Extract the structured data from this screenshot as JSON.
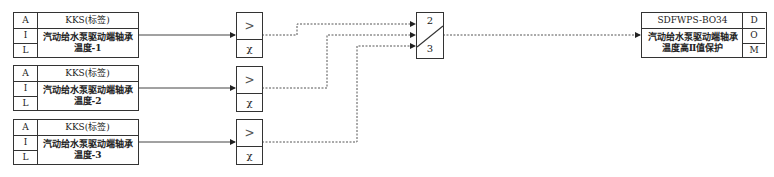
{
  "inputs": [
    {
      "rows": [
        "A",
        "I",
        "L"
      ],
      "tag": "KKS(标签)",
      "desc_line1": "汽动给水泵驱动端轴承",
      "desc_line2": "温度-1"
    },
    {
      "rows": [
        "A",
        "I",
        "L"
      ],
      "tag": "KKS(标签)",
      "desc_line1": "汽动给水泵驱动端轴承",
      "desc_line2": "温度-2"
    },
    {
      "rows": [
        "A",
        "I",
        "L"
      ],
      "tag": "KKS(标签)",
      "desc_line1": "汽动给水泵驱动端轴承",
      "desc_line2": "温度-3"
    }
  ],
  "comparators": [
    {
      "op": ">",
      "quality": "χ"
    },
    {
      "op": ">",
      "quality": "χ"
    },
    {
      "op": ">",
      "quality": "χ"
    }
  ],
  "voter": {
    "top": "2",
    "bottom": "3"
  },
  "output": {
    "tag": "SDFWPS-BO34",
    "desc_line1": "汽动给水泵驱动端轴承",
    "desc_line2": "温度高Ⅱ值保护",
    "rows": [
      "D",
      "O",
      "M"
    ]
  },
  "colors": {
    "line": "#333333",
    "background": "#ffffff"
  }
}
